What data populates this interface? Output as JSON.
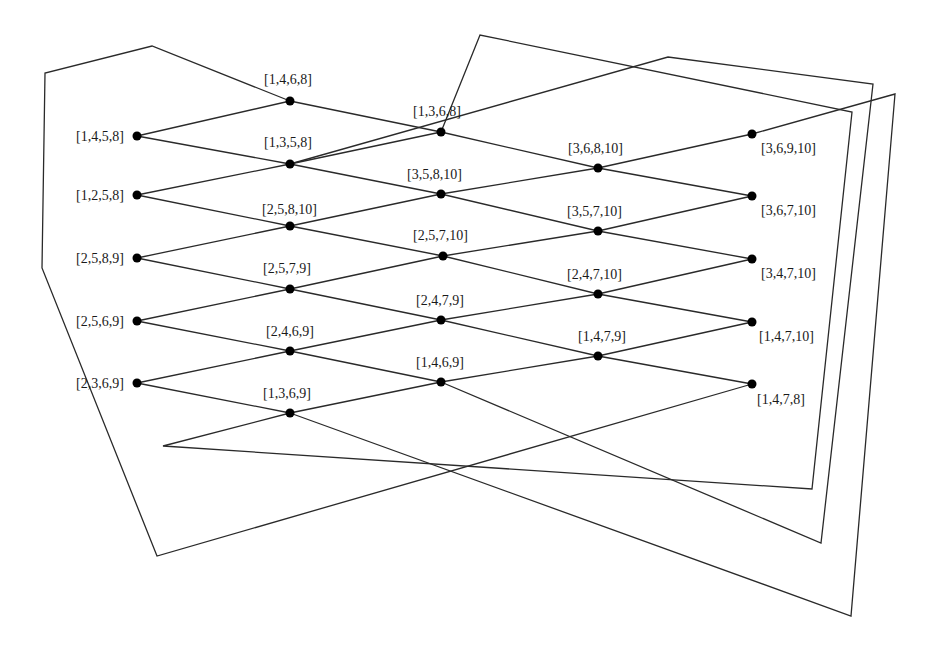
{
  "colors": {
    "line": "#2a2a2a",
    "node": "#000000",
    "text": "#1a1a1a",
    "background": "#ffffff"
  },
  "nodes": [
    {
      "id": "n1458",
      "label": "[1,4,5,8]",
      "x": 137,
      "y": 136,
      "lx": 76,
      "ly": 141,
      "anchor": "start"
    },
    {
      "id": "n1258",
      "label": "[1,2,5,8]",
      "x": 137,
      "y": 195,
      "lx": 76,
      "ly": 200,
      "anchor": "start"
    },
    {
      "id": "n2589",
      "label": "[2,5,8,9]",
      "x": 137,
      "y": 258,
      "lx": 76,
      "ly": 263,
      "anchor": "start"
    },
    {
      "id": "n2569",
      "label": "[2,5,6,9]",
      "x": 137,
      "y": 321,
      "lx": 76,
      "ly": 326,
      "anchor": "start"
    },
    {
      "id": "n2369",
      "label": "[2,3,6,9]",
      "x": 137,
      "y": 383,
      "lx": 76,
      "ly": 388,
      "anchor": "start"
    },
    {
      "id": "n1468",
      "label": "[1,4,6,8]",
      "x": 290,
      "y": 101,
      "lx": 264,
      "ly": 84,
      "anchor": "start"
    },
    {
      "id": "n1358",
      "label": "[1,3,5,8]",
      "x": 290,
      "y": 164,
      "lx": 264,
      "ly": 147,
      "anchor": "start"
    },
    {
      "id": "n25810",
      "label": "[2,5,8,10]",
      "x": 290,
      "y": 226,
      "lx": 262,
      "ly": 214,
      "anchor": "start"
    },
    {
      "id": "n2579",
      "label": "[2,5,7,9]",
      "x": 290,
      "y": 289,
      "lx": 263,
      "ly": 273,
      "anchor": "start"
    },
    {
      "id": "n2469",
      "label": "[2,4,6,9]",
      "x": 290,
      "y": 351,
      "lx": 266,
      "ly": 336,
      "anchor": "start"
    },
    {
      "id": "n1369",
      "label": "[1,3,6,9]",
      "x": 290,
      "y": 413,
      "lx": 263,
      "ly": 398,
      "anchor": "start"
    },
    {
      "id": "n1368",
      "label": "[1,3,6,8]",
      "x": 441,
      "y": 132,
      "lx": 413,
      "ly": 116,
      "anchor": "start"
    },
    {
      "id": "n35810",
      "label": "[3,5,8,10]",
      "x": 441,
      "y": 194,
      "lx": 407,
      "ly": 179,
      "anchor": "start"
    },
    {
      "id": "n25710",
      "label": "[2,5,7,10]",
      "x": 443,
      "y": 256,
      "lx": 413,
      "ly": 240,
      "anchor": "start"
    },
    {
      "id": "n2479",
      "label": "[2,4,7,9]",
      "x": 441,
      "y": 320,
      "lx": 416,
      "ly": 305,
      "anchor": "start"
    },
    {
      "id": "n1469",
      "label": "[1,4,6,9]",
      "x": 441,
      "y": 382,
      "lx": 416,
      "ly": 367,
      "anchor": "start"
    },
    {
      "id": "n36810",
      "label": "[3,6,8,10]",
      "x": 598,
      "y": 168,
      "lx": 568,
      "ly": 153,
      "anchor": "start"
    },
    {
      "id": "n35710",
      "label": "[3,5,7,10]",
      "x": 598,
      "y": 231,
      "lx": 567,
      "ly": 216,
      "anchor": "start"
    },
    {
      "id": "n24710",
      "label": "[2,4,7,10]",
      "x": 598,
      "y": 294,
      "lx": 567,
      "ly": 279,
      "anchor": "start"
    },
    {
      "id": "n1479",
      "label": "[1,4,7,9]",
      "x": 598,
      "y": 356,
      "lx": 578,
      "ly": 341,
      "anchor": "start"
    },
    {
      "id": "n36910",
      "label": "[3,6,9,10]",
      "x": 752,
      "y": 134,
      "lx": 761,
      "ly": 153,
      "anchor": "start"
    },
    {
      "id": "n36710",
      "label": "[3,6,7,10]",
      "x": 752,
      "y": 196,
      "lx": 761,
      "ly": 215,
      "anchor": "start"
    },
    {
      "id": "n34710",
      "label": "[3,4,7,10]",
      "x": 752,
      "y": 259,
      "lx": 761,
      "ly": 278,
      "anchor": "start"
    },
    {
      "id": "n14710",
      "label": "[1,4,7,10]",
      "x": 752,
      "y": 322,
      "lx": 759,
      "ly": 341,
      "anchor": "start"
    },
    {
      "id": "n1478",
      "label": "[1,4,7,8]",
      "x": 752,
      "y": 384,
      "lx": 757,
      "ly": 404,
      "anchor": "start"
    }
  ],
  "edges": [
    [
      "n1458",
      "n1468"
    ],
    [
      "n1458",
      "n1358"
    ],
    [
      "n1258",
      "n1358"
    ],
    [
      "n1258",
      "n25810"
    ],
    [
      "n2589",
      "n25810"
    ],
    [
      "n2589",
      "n2579"
    ],
    [
      "n2569",
      "n2579"
    ],
    [
      "n2569",
      "n2469"
    ],
    [
      "n2369",
      "n2469"
    ],
    [
      "n2369",
      "n1369"
    ],
    [
      "n1468",
      "n1368"
    ],
    [
      "n1358",
      "n1368"
    ],
    [
      "n1358",
      "n35810"
    ],
    [
      "n25810",
      "n35810"
    ],
    [
      "n25810",
      "n25710"
    ],
    [
      "n2579",
      "n25710"
    ],
    [
      "n2579",
      "n2479"
    ],
    [
      "n2469",
      "n2479"
    ],
    [
      "n2469",
      "n1469"
    ],
    [
      "n1369",
      "n1469"
    ],
    [
      "n1368",
      "n36810"
    ],
    [
      "n35810",
      "n36810"
    ],
    [
      "n35810",
      "n35710"
    ],
    [
      "n25710",
      "n35710"
    ],
    [
      "n25710",
      "n24710"
    ],
    [
      "n2479",
      "n24710"
    ],
    [
      "n2479",
      "n1479"
    ],
    [
      "n1469",
      "n1479"
    ],
    [
      "n36810",
      "n36910"
    ],
    [
      "n36810",
      "n36710"
    ],
    [
      "n35710",
      "n36710"
    ],
    [
      "n35710",
      "n34710"
    ],
    [
      "n24710",
      "n34710"
    ],
    [
      "n24710",
      "n14710"
    ],
    [
      "n1479",
      "n14710"
    ],
    [
      "n1479",
      "n1478"
    ]
  ],
  "wrap_paths": [
    {
      "name": "wrap-left-outer",
      "points": [
        [
          290,
          101
        ],
        [
          152,
          46
        ],
        [
          45,
          73
        ],
        [
          42,
          268
        ],
        [
          157,
          556
        ],
        [
          752,
          384
        ]
      ]
    },
    {
      "name": "wrap-top-a",
      "points": [
        [
          441,
          132
        ],
        [
          480,
          35
        ],
        [
          852,
          112
        ],
        [
          812,
          489
        ],
        [
          163,
          446
        ],
        [
          290,
          413
        ]
      ]
    },
    {
      "name": "wrap-top-b",
      "points": [
        [
          290,
          164
        ],
        [
          668,
          57
        ],
        [
          873,
          84
        ],
        [
          821,
          543
        ],
        [
          441,
          382
        ]
      ]
    },
    {
      "name": "wrap-right",
      "points": [
        [
          752,
          134
        ],
        [
          895,
          94
        ],
        [
          851,
          616
        ],
        [
          290,
          413
        ]
      ]
    }
  ]
}
